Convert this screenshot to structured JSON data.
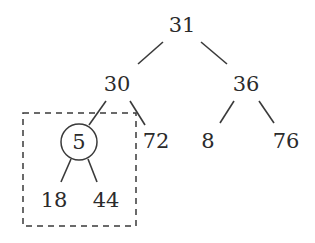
{
  "diagram": {
    "type": "binary-tree",
    "nodes": {
      "root": "31",
      "left": "30",
      "right": "36",
      "left_left": "5",
      "left_right": "72",
      "right_left": "8",
      "right_right": "76",
      "left_left_left": "18",
      "left_left_right": "44"
    },
    "highlighted_node": "5",
    "highlight_style": "circle",
    "subtree_box": {
      "style": "dashed",
      "contains": [
        "5",
        "18",
        "44"
      ]
    },
    "colors": {
      "stroke": "#3a3a3a",
      "text": "#2b2b2b",
      "background": "#ffffff"
    }
  }
}
